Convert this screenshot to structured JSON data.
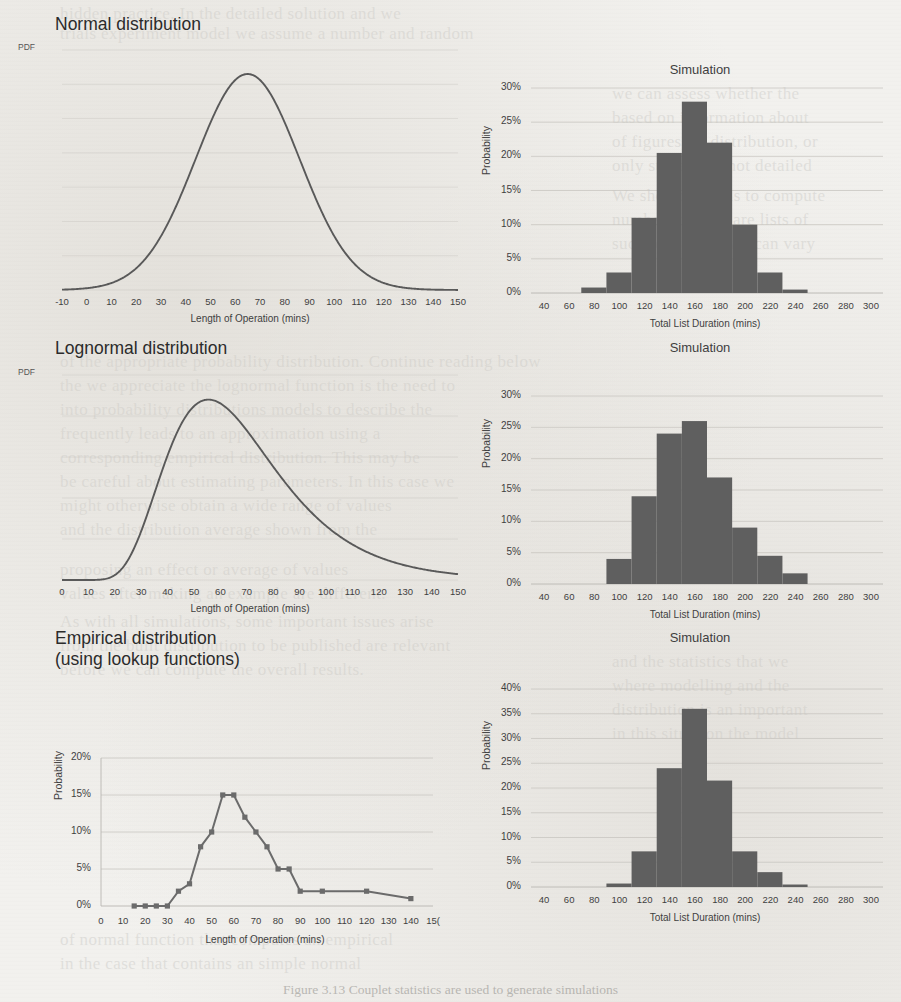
{
  "sections": [
    {
      "heading": "Normal distribution",
      "pdf_label": "PDF",
      "left_chart": {
        "title": "",
        "xlabel": "Length of Operation (mins)",
        "ylabel": "PDF",
        "xticks": [
          "-10",
          "0",
          "10",
          "20",
          "30",
          "40",
          "50",
          "60",
          "70",
          "80",
          "90",
          "100",
          "110",
          "120",
          "130",
          "140",
          "150"
        ]
      },
      "right_chart": {
        "title": "Simulation",
        "xlabel": "Total List Duration (mins)",
        "ylabel": "Probability",
        "yticks": [
          "0%",
          "5%",
          "10%",
          "15%",
          "20%",
          "25%",
          "30%"
        ],
        "xticks": [
          "40",
          "60",
          "80",
          "100",
          "120",
          "140",
          "160",
          "180",
          "200",
          "220",
          "240",
          "260",
          "280",
          "300"
        ]
      }
    },
    {
      "heading": "Lognormal distribution",
      "pdf_label": "PDF",
      "left_chart": {
        "title": "",
        "xlabel": "Length of Operation (mins)",
        "ylabel": "PDF",
        "xticks": [
          "0",
          "10",
          "20",
          "30",
          "40",
          "50",
          "60",
          "70",
          "80",
          "90",
          "100",
          "110",
          "120",
          "130",
          "140",
          "150"
        ]
      },
      "right_chart": {
        "title": "Simulation",
        "xlabel": "Total List Duration (mins)",
        "ylabel": "Probability",
        "yticks": [
          "0%",
          "5%",
          "10%",
          "15%",
          "20%",
          "25%",
          "30%"
        ],
        "xticks": [
          "40",
          "60",
          "80",
          "100",
          "120",
          "140",
          "160",
          "180",
          "200",
          "220",
          "240",
          "260",
          "280",
          "300"
        ]
      }
    },
    {
      "heading": "Empirical distribution\n(using lookup functions)",
      "pdf_label": "",
      "left_chart": {
        "title": "",
        "xlabel": "Length of Operation (mins)",
        "ylabel": "Probability",
        "yticks": [
          "0%",
          "5%",
          "10%",
          "15%",
          "20%"
        ],
        "xticks": [
          "0",
          "10",
          "20",
          "30",
          "40",
          "50",
          "60",
          "70",
          "80",
          "90",
          "100",
          "110",
          "120",
          "130",
          "140",
          "15("
        ]
      },
      "right_chart": {
        "title": "Simulation",
        "xlabel": "Total List Duration (mins)",
        "ylabel": "Probability",
        "yticks": [
          "0%",
          "5%",
          "10%",
          "15%",
          "20%",
          "25%",
          "30%",
          "35%",
          "40%"
        ],
        "xticks": [
          "40",
          "60",
          "80",
          "100",
          "120",
          "140",
          "160",
          "180",
          "200",
          "220",
          "240",
          "260",
          "280",
          "300"
        ]
      }
    }
  ],
  "colors": {
    "curve": "#595959",
    "bar": "#5f5f5f",
    "grid": "#c9c7c2",
    "text": "#3f3f3f",
    "page_background": "#f2f1ee"
  },
  "caption": "Figure 3.13  Couplet statistics are used to generate simulations",
  "bleed_text": [
    {
      "x": 60,
      "y": 4,
      "t": "hidden practice. In the detailed solution and we"
    },
    {
      "x": 60,
      "y": 24,
      "t": "trials experiment model we assume a number and random"
    },
    {
      "x": 612,
      "y": 84,
      "t": "we can assess whether the"
    },
    {
      "x": 612,
      "y": 108,
      "t": "based on information about"
    },
    {
      "x": 612,
      "y": 132,
      "t": "of figures, or distribution, or"
    },
    {
      "x": 612,
      "y": 156,
      "t": "only stages and not detailed"
    },
    {
      "x": 612,
      "y": 186,
      "t": "We should do this to compute"
    },
    {
      "x": 612,
      "y": 210,
      "t": "number. If these are lists of"
    },
    {
      "x": 612,
      "y": 234,
      "t": "such operations we can vary"
    },
    {
      "x": 60,
      "y": 352,
      "t": "of the appropriate probability distribution. Continue reading below"
    },
    {
      "x": 60,
      "y": 376,
      "t": "the we appreciate the lognormal function is the need to"
    },
    {
      "x": 60,
      "y": 400,
      "t": "into probability distributions models to describe the"
    },
    {
      "x": 60,
      "y": 424,
      "t": "frequently leads to an approximation using a"
    },
    {
      "x": 60,
      "y": 448,
      "t": "corresponding empirical distribution. This may be"
    },
    {
      "x": 60,
      "y": 472,
      "t": "be careful about estimating parameters. In this case we"
    },
    {
      "x": 60,
      "y": 496,
      "t": "might otherwise obtain a wide range of values"
    },
    {
      "x": 60,
      "y": 520,
      "t": "and the distribution average shown from the"
    },
    {
      "x": 60,
      "y": 560,
      "t": "proposing an effect or average of values"
    },
    {
      "x": 60,
      "y": 584,
      "t": "values after making an example are different."
    },
    {
      "x": 60,
      "y": 612,
      "t": "As with all simulations, some important issues arise"
    },
    {
      "x": 60,
      "y": 636,
      "t": "from the built distribution to be published are relevant"
    },
    {
      "x": 60,
      "y": 660,
      "t": "before we can compute the overall results."
    },
    {
      "x": 612,
      "y": 652,
      "t": "and the statistics that we"
    },
    {
      "x": 612,
      "y": 676,
      "t": "where modelling and the"
    },
    {
      "x": 612,
      "y": 700,
      "t": "distribution is an important"
    },
    {
      "x": 612,
      "y": 724,
      "t": "in this situation the model"
    },
    {
      "x": 60,
      "y": 930,
      "t": "of normal function that computes an empirical"
    },
    {
      "x": 60,
      "y": 954,
      "t": "in the case that contains an simple normal"
    }
  ],
  "chart_data": [
    {
      "id": "normal-pdf",
      "type": "line",
      "title": "Normal distribution",
      "xlabel": "Length of Operation (mins)",
      "ylabel": "PDF",
      "xlim": [
        -10,
        150
      ],
      "distribution": "normal",
      "mean": 65,
      "sd": 21,
      "xticks": [
        -10,
        0,
        10,
        20,
        30,
        40,
        50,
        60,
        70,
        80,
        90,
        100,
        110,
        120,
        130,
        140,
        150
      ]
    },
    {
      "id": "normal-simulation",
      "type": "bar",
      "title": "Simulation",
      "xlabel": "Total List Duration (mins)",
      "ylabel": "Probability",
      "xlim": [
        30,
        310
      ],
      "ylim": [
        0,
        0.3
      ],
      "bin_width": 20,
      "bin_starts": [
        70,
        90,
        110,
        130,
        150,
        170,
        190,
        210,
        230
      ],
      "categories": [
        "70-90",
        "90-110",
        "110-130",
        "130-150",
        "150-170",
        "170-190",
        "190-210",
        "210-230",
        "230-250"
      ],
      "values": [
        0.008,
        0.03,
        0.11,
        0.205,
        0.28,
        0.22,
        0.1,
        0.03,
        0.005
      ],
      "xticks": [
        40,
        60,
        80,
        100,
        120,
        140,
        160,
        180,
        200,
        220,
        240,
        260,
        280,
        300
      ],
      "yticks": [
        0,
        0.05,
        0.1,
        0.15,
        0.2,
        0.25,
        0.3
      ]
    },
    {
      "id": "lognormal-pdf",
      "type": "line",
      "title": "Lognormal distribution",
      "xlabel": "Length of Operation (mins)",
      "ylabel": "PDF",
      "xlim": [
        0,
        150
      ],
      "distribution": "lognormal",
      "meanlog": 4.16,
      "sdlog": 0.38,
      "mode": 57,
      "xticks": [
        0,
        10,
        20,
        30,
        40,
        50,
        60,
        70,
        80,
        90,
        100,
        110,
        120,
        130,
        140,
        150
      ]
    },
    {
      "id": "lognormal-simulation",
      "type": "bar",
      "title": "Simulation",
      "xlabel": "Total List Duration (mins)",
      "ylabel": "Probability",
      "xlim": [
        30,
        310
      ],
      "ylim": [
        0,
        0.3
      ],
      "bin_width": 20,
      "bin_starts": [
        90,
        110,
        130,
        150,
        170,
        190,
        210,
        230
      ],
      "categories": [
        "90-110",
        "110-130",
        "130-150",
        "150-170",
        "170-190",
        "190-210",
        "210-230",
        "230-250"
      ],
      "values": [
        0.04,
        0.14,
        0.24,
        0.26,
        0.17,
        0.09,
        0.045,
        0.017
      ],
      "xticks": [
        40,
        60,
        80,
        100,
        120,
        140,
        160,
        180,
        200,
        220,
        240,
        260,
        280,
        300
      ],
      "yticks": [
        0,
        0.05,
        0.1,
        0.15,
        0.2,
        0.25,
        0.3
      ]
    },
    {
      "id": "empirical-pdf",
      "type": "line",
      "title": "Empirical distribution (using lookup functions)",
      "xlabel": "Length of Operation (mins)",
      "ylabel": "Probability",
      "xlim": [
        0,
        150
      ],
      "ylim": [
        0,
        0.2
      ],
      "x": [
        15,
        20,
        25,
        30,
        35,
        40,
        45,
        50,
        55,
        60,
        65,
        70,
        75,
        80,
        85,
        90,
        100,
        120,
        140
      ],
      "values": [
        0.0,
        0.0,
        0.0,
        0.0,
        0.02,
        0.03,
        0.08,
        0.1,
        0.15,
        0.15,
        0.12,
        0.1,
        0.08,
        0.05,
        0.05,
        0.02,
        0.02,
        0.02,
        0.01
      ],
      "xticks": [
        0,
        10,
        20,
        30,
        40,
        50,
        60,
        70,
        80,
        90,
        100,
        110,
        120,
        130,
        140,
        150
      ],
      "yticks": [
        0,
        0.05,
        0.1,
        0.15,
        0.2
      ],
      "markers": true
    },
    {
      "id": "empirical-simulation",
      "type": "bar",
      "title": "Simulation",
      "xlabel": "Total List Duration (mins)",
      "ylabel": "Probability",
      "xlim": [
        30,
        310
      ],
      "ylim": [
        0,
        0.4
      ],
      "bin_width": 20,
      "bin_starts": [
        90,
        110,
        130,
        150,
        170,
        190,
        210,
        230
      ],
      "categories": [
        "90-110",
        "110-130",
        "130-150",
        "150-170",
        "170-190",
        "190-210",
        "210-230",
        "230-250"
      ],
      "values": [
        0.007,
        0.072,
        0.24,
        0.36,
        0.215,
        0.072,
        0.03,
        0.005
      ],
      "xticks": [
        40,
        60,
        80,
        100,
        120,
        140,
        160,
        180,
        200,
        220,
        240,
        260,
        280,
        300
      ],
      "yticks": [
        0,
        0.05,
        0.1,
        0.15,
        0.2,
        0.25,
        0.3,
        0.35,
        0.4
      ]
    }
  ]
}
